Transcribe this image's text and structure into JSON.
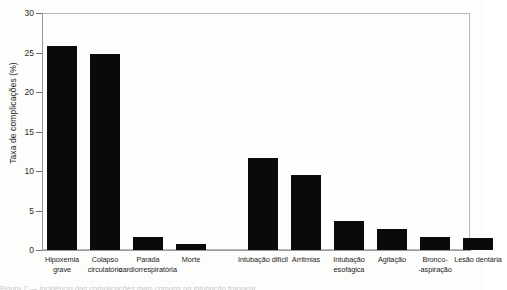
{
  "chart_data": {
    "type": "bar",
    "title": "",
    "xlabel": "",
    "ylabel": "Taxa de complicações (%)",
    "ylim": [
      0,
      30
    ],
    "yticks": [
      0,
      5,
      10,
      15,
      20,
      25,
      30
    ],
    "ytick_labels": [
      "0",
      "5",
      "10",
      "15",
      "20",
      "25",
      "30"
    ],
    "grid": false,
    "legend": "none",
    "bar_color": "#0a0a0a",
    "frame_color": "#b9b9b9",
    "categories": [
      "Hipoxemia\ngrave",
      "Colapso\ncirculatório",
      "Parada\ncardiorrespiratória",
      "Morte",
      "Intubação difícil",
      "Arritmias",
      "Intubação\nesofágica",
      "Agitação",
      "Bronco-\n-aspiração",
      "Lesão dentária"
    ],
    "values": [
      25.8,
      24.8,
      1.7,
      0.7,
      11.6,
      9.5,
      3.7,
      2.6,
      1.6,
      1.5
    ],
    "groups": [
      {
        "name": "Complicações graves",
        "indices": [
          0,
          1,
          2,
          3
        ]
      },
      {
        "name": "Complicações menores",
        "indices": [
          4,
          5,
          6,
          7,
          8,
          9
        ]
      }
    ]
  },
  "caption": {
    "cut_off_line": "Figura 2 — Incidência das complicações mais comuns na intubação traqueal"
  }
}
